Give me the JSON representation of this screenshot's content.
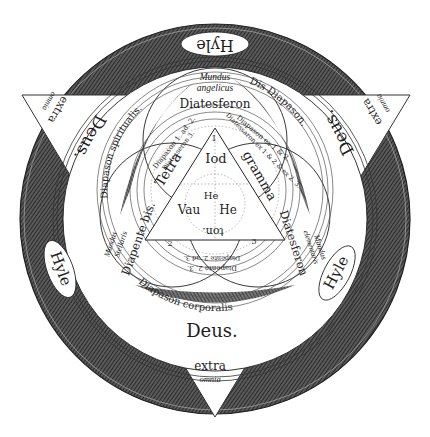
{
  "diagram": {
    "colors": {
      "ink": "#1e1e1e",
      "hatch_dark": "#3c3c3c",
      "paper": "#ffffff"
    },
    "outer_ring": {
      "hyle_top": "Hyle",
      "hyle_left": "Hyle",
      "hyle_right": "Hyle"
    },
    "triangle_corners": {
      "top_left": {
        "deus": "Deus.",
        "extra": "extra",
        "omnia": "omnia"
      },
      "top_right": {
        "deus": "Deus.",
        "extra": "extra",
        "omnia": "omnia"
      },
      "bottom": {
        "deus": "Deus.",
        "extra": "extra",
        "omnia": "omnia"
      }
    },
    "ring_labels": {
      "diapason_spiritualis": "Diapason spiritualis.",
      "dis_diapason": "Dis Diapason.",
      "diapason_corporalis": "Diapason corporalis"
    },
    "circles": {
      "top": {
        "mundus": "Mundus",
        "sub": "angelicus",
        "interval": "Diatesferon"
      },
      "left": {
        "mundus": "Mundus",
        "sub": "Stellaris",
        "interval": "Diapente bis."
      },
      "right": {
        "mundus": "Mundus",
        "sub": "elementaris",
        "interval": "Diatesferon"
      }
    },
    "inner_arcs": {
      "left_outer": "Diapason 1. ad. 2.",
      "left_inner": "Diatesseron 3.",
      "right_outer": "Diapason ex 1 & 2.",
      "right_inner": "Diatessaron ex 1 & 2 & ex 2. 3.",
      "bottom_outer": "Diapente 2. 3.",
      "bottom_inner": "Diapente 2. ad 3."
    },
    "tetragrammaton": {
      "side_left": "Tetra",
      "side_right": "gramma",
      "side_bottom": "ton.",
      "top": "Iod",
      "center": "He",
      "left": "Vau",
      "right": "He",
      "num_top": "1",
      "num_left": "2",
      "num_right": "3"
    }
  }
}
